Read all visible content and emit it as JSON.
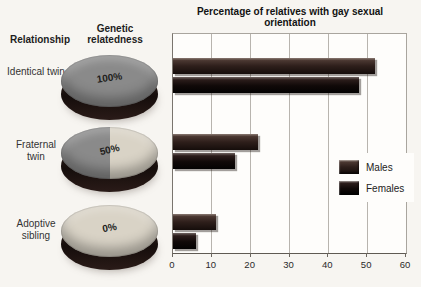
{
  "figure": {
    "title": "Percentage of relatives with gay sexual orientation"
  },
  "left_panel": {
    "relationship_header": "Relationship",
    "relatedness_header": "Genetic relatedness",
    "rows": [
      {
        "label": "Identical twin",
        "percent": 100,
        "percent_label": "100%"
      },
      {
        "label": "Fraternal twin",
        "percent": 50,
        "percent_label": "50%"
      },
      {
        "label": "Adoptive sibling",
        "percent": 0,
        "percent_label": "0%"
      }
    ]
  },
  "chart_data": {
    "type": "bar",
    "orientation": "horizontal",
    "title": "Percentage of relatives with gay sexual orientation",
    "categories": [
      "Identical twin",
      "Fraternal twin",
      "Adoptive sibling"
    ],
    "series": [
      {
        "name": "Males",
        "values": [
          52,
          22,
          11
        ],
        "color": "#2e1f1b"
      },
      {
        "name": "Females",
        "values": [
          48,
          16,
          6
        ],
        "color": "#100908"
      }
    ],
    "xlim": [
      0,
      60
    ],
    "xticks": [
      0,
      10,
      20,
      30,
      40,
      50,
      60
    ],
    "grid": true,
    "legend_position": "right-middle"
  },
  "colors": {
    "dark_slice": "#8a8a8a",
    "light_slice": "#d9d3c6",
    "pie_rim": "#1c1210",
    "males_bar": "#2e1f1b",
    "females_bar": "#100908",
    "gridline": "#b8b4ae"
  }
}
